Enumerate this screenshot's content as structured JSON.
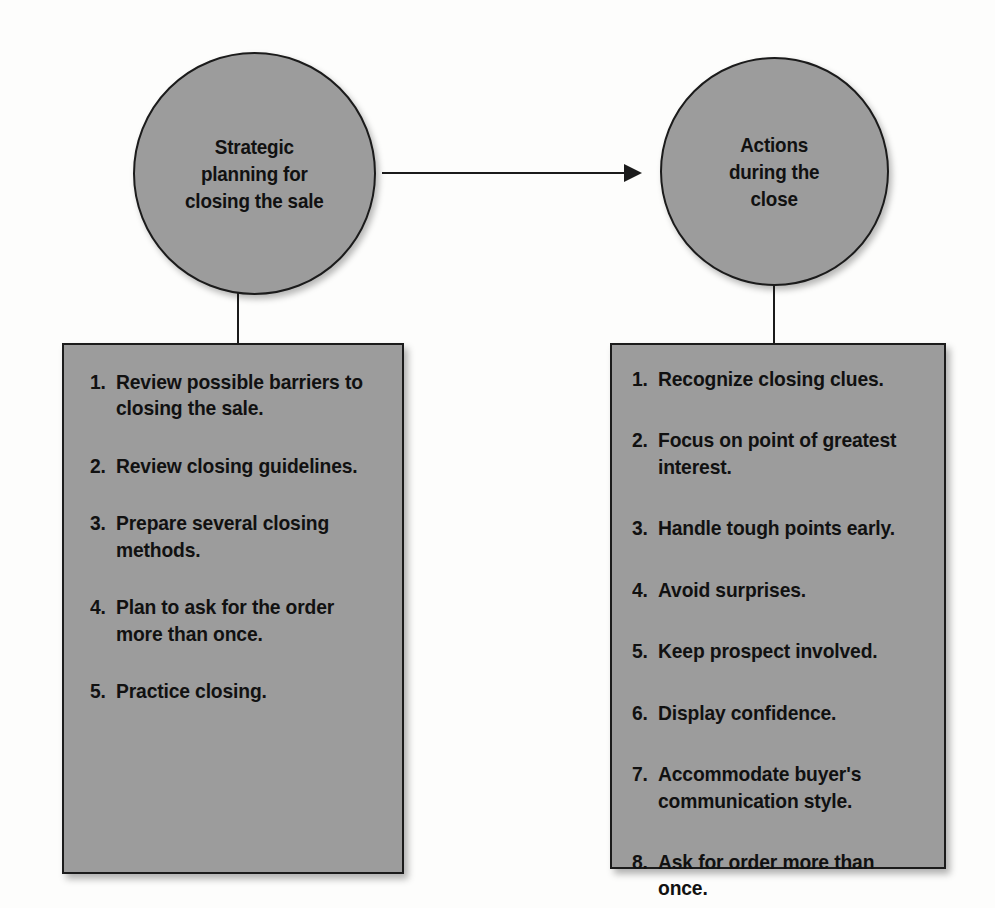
{
  "diagram": {
    "type": "process-flow",
    "nodes": {
      "circle_left": {
        "id": "strategic-planning",
        "label": "Strategic\nplanning for\nclosing the sale",
        "shape": "circle",
        "fill": "#9c9c9c",
        "border": "#1b1b1b"
      },
      "circle_right": {
        "id": "actions-during-close",
        "label": "Actions\nduring the\nclose",
        "shape": "circle",
        "fill": "#9c9c9c",
        "border": "#1b1b1b"
      },
      "box_left": {
        "id": "planning-steps",
        "shape": "rectangle",
        "fill": "#9c9c9c",
        "border": "#1b1b1b",
        "items": [
          {
            "num": "1.",
            "text": "Review possible barriers to closing the sale."
          },
          {
            "num": "2.",
            "text": "Review closing guidelines."
          },
          {
            "num": "3.",
            "text": "Prepare several closing methods."
          },
          {
            "num": "4.",
            "text": "Plan to ask for the order more than once."
          },
          {
            "num": "5.",
            "text": "Practice closing."
          }
        ]
      },
      "box_right": {
        "id": "action-steps",
        "shape": "rectangle",
        "fill": "#9c9c9c",
        "border": "#1b1b1b",
        "items": [
          {
            "num": "1.",
            "text": "Recognize closing clues."
          },
          {
            "num": "2.",
            "text": "Focus on point of greatest interest."
          },
          {
            "num": "3.",
            "text": "Handle tough points early."
          },
          {
            "num": "4.",
            "text": "Avoid surprises."
          },
          {
            "num": "5.",
            "text": "Keep prospect involved."
          },
          {
            "num": "6.",
            "text": "Display confidence."
          },
          {
            "num": "7.",
            "text": "Accommodate buyer's communication style."
          },
          {
            "num": "8.",
            "text": "Ask for order more than once."
          }
        ]
      }
    },
    "connectors": [
      {
        "id": "flow-arrow",
        "from": "strategic-planning",
        "to": "actions-during-close",
        "style": "arrow-right",
        "color": "#1b1b1b"
      },
      {
        "id": "stem-left",
        "from": "strategic-planning",
        "to": "planning-steps",
        "style": "line-vertical",
        "color": "#1b1b1b"
      },
      {
        "id": "stem-right",
        "from": "actions-during-close",
        "to": "action-steps",
        "style": "line-vertical",
        "color": "#1b1b1b"
      }
    ]
  }
}
